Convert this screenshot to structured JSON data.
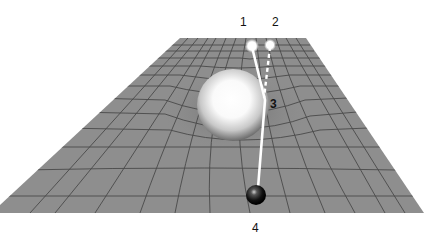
{
  "diagram": {
    "labels": [
      {
        "id": "1",
        "text": "1",
        "x": 240,
        "y": 16
      },
      {
        "id": "2",
        "text": "2",
        "x": 272,
        "y": 16
      },
      {
        "id": "3",
        "text": "3",
        "x": 270,
        "y": 98
      },
      {
        "id": "4",
        "text": "4",
        "x": 252,
        "y": 222
      }
    ],
    "colors": {
      "grid_fill": "#8e8e8e",
      "grid_line": "#4a4a4a",
      "path": "#ffffff",
      "massive_sphere": "#ffffff",
      "observer_sphere": "#111111"
    },
    "elements": {
      "massive_body": "large white sphere",
      "observer": "small black sphere",
      "source_actual": "bright point 1",
      "source_apparent": "bright point 2",
      "solid_path": "light path from 1 bent at 3 to 4",
      "dashed_path": "apparent straight path from 2 to 3"
    }
  }
}
